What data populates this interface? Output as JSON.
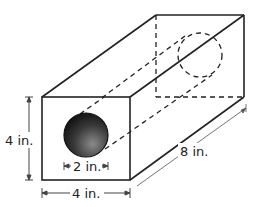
{
  "diagram": {
    "type": "rectangular-prism-with-cylindrical-hole",
    "labels": {
      "height": "4 in.",
      "width": "4 in.",
      "length": "8 in.",
      "hole_diameter": "2 in."
    },
    "colors": {
      "stroke": "#222222",
      "hole_fill_dark": "#1a1a1a",
      "hole_fill_light": "#777777",
      "dimension_line": "#555555"
    }
  }
}
